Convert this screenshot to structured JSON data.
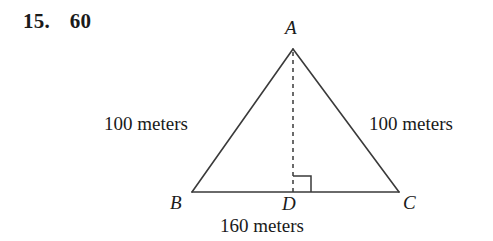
{
  "answer": {
    "question_number": "15.",
    "value": "60"
  },
  "figure": {
    "type": "isosceles-triangle-with-altitude",
    "vertices": {
      "apex": "A",
      "bottom_left": "B",
      "bottom_right": "C",
      "foot_of_altitude": "D"
    },
    "labels": {
      "left_side": "100 meters",
      "right_side": "100 meters",
      "base": "160 meters"
    },
    "marks": {
      "right_angle_at": "D",
      "altitude_style": "dashed"
    },
    "colors": {
      "stroke": "#3a3a3a",
      "text": "#1a1a1a",
      "background": "#ffffff"
    }
  }
}
